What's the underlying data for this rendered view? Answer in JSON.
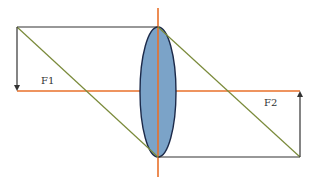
{
  "diagram": {
    "type": "optics-ray-diagram",
    "labels": {
      "focus_left": "F1",
      "focus_right": "F2"
    },
    "colors": {
      "axis": "#e8702a",
      "lens_fill": "#7ba3c8",
      "lens_stroke": "#1c2a4a",
      "ray_diagonal": "#7a8a3a",
      "ray_line": "#333333",
      "background": "#ffffff"
    }
  }
}
